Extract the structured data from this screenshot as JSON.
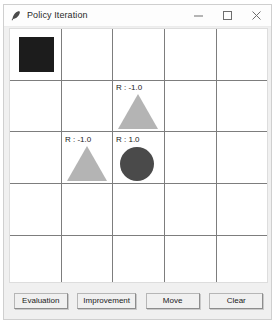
{
  "window": {
    "title": "Policy Iteration",
    "icon": "feather-icon",
    "controls": {
      "minimize": "minimize-icon",
      "maximize": "maximize-icon",
      "close": "close-icon"
    }
  },
  "grid": {
    "rows": 5,
    "cols": 5,
    "line_color": "#7d7d7d",
    "background": "#ffffff",
    "cells": [
      {
        "name": "agent",
        "shape": "square",
        "row": 1,
        "col": 1,
        "color": "#1c1c1c",
        "reward_label": ""
      },
      {
        "name": "obstacle-1",
        "shape": "triangle",
        "row": 2,
        "col": 3,
        "color": "#b4b4b4",
        "reward_label": "R : -1.0"
      },
      {
        "name": "obstacle-2",
        "shape": "triangle",
        "row": 3,
        "col": 2,
        "color": "#b4b4b4",
        "reward_label": "R : -1.0"
      },
      {
        "name": "goal",
        "shape": "circle",
        "row": 3,
        "col": 3,
        "color": "#4a4a4a",
        "reward_label": "R : 1.0"
      }
    ]
  },
  "buttons": {
    "evaluation": "Evaluation",
    "improvement": "Improvement",
    "move": "Move",
    "clear": "Clear"
  }
}
